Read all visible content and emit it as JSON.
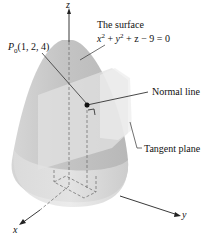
{
  "diagram": {
    "surface_label_line1": "The surface",
    "surface_equation": {
      "x": "x",
      "y": "y",
      "z": "z",
      "exp": "2",
      "rest": " + z − 9 = 0",
      "plus": " + "
    },
    "point_label": {
      "P": "P",
      "sub": "0",
      "coords": "(1, 2, 4)"
    },
    "normal_line_label": "Normal line",
    "tangent_plane_label": "Tangent plane",
    "axes": {
      "x": "x",
      "y": "y",
      "z": "z"
    },
    "colors": {
      "surface": "#c8c8c8",
      "surface_light": "#e4e4e4",
      "plane": "#dedede",
      "line": "#333333",
      "point": "#111111"
    }
  }
}
